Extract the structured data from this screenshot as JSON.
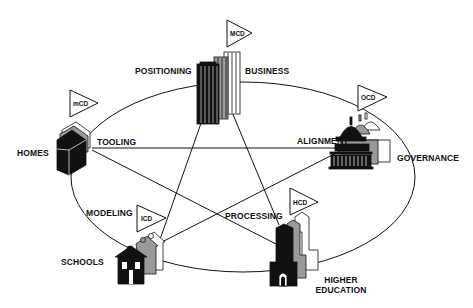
{
  "diagram": {
    "type": "star-in-ellipse",
    "colors": {
      "ink": "#111111",
      "gray": "#8a8a8a",
      "light": "#ffffff",
      "background": "#ffffff"
    },
    "nodes": [
      {
        "id": "business",
        "label": "BUSINESS",
        "flag": "MCD",
        "icon": "skyscraper-icon"
      },
      {
        "id": "governance",
        "label": "GOVERNANCE",
        "flag": "OCD",
        "icon": "capitol-dome-icon"
      },
      {
        "id": "higher-education",
        "label_line1": "HIGHER",
        "label_line2": "EDUCATION",
        "flag": "HCD",
        "icon": "university-tower-icon"
      },
      {
        "id": "schools",
        "label": "SCHOOLS",
        "flag": "ICD",
        "icon": "schoolhouse-icon"
      },
      {
        "id": "homes",
        "label": "HOMES",
        "flag": "mCD",
        "icon": "house-icon"
      }
    ],
    "edge_labels": {
      "positioning": "POSITIONING",
      "alignment": "ALIGNMENT",
      "processing": "PROCESSING",
      "modeling": "MODELING",
      "tooling": "TOOLING"
    },
    "connections": [
      {
        "from": "business",
        "to": "schools"
      },
      {
        "from": "business",
        "to": "higher-education"
      },
      {
        "from": "homes",
        "to": "governance"
      },
      {
        "from": "homes",
        "to": "higher-education"
      },
      {
        "from": "schools",
        "to": "governance"
      }
    ]
  }
}
